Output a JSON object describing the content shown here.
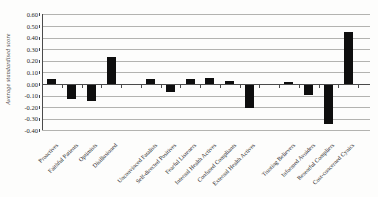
{
  "chart_data": {
    "type": "bar",
    "title": "",
    "xlabel": "",
    "ylabel": "Average standardised score",
    "ylim": [
      -0.4,
      0.6
    ],
    "ytick_step": 0.1,
    "ytick_labels": [
      "0.60",
      "0.50",
      "0.40",
      "0.30",
      "0.20",
      "0.10",
      "0.00",
      "-0.10",
      "-0.20",
      "-0.30",
      "-0.40"
    ],
    "grid": true,
    "legend": "none",
    "bar_color": "#0e0e0e",
    "gridline_color": "#b3b3b0",
    "axis_color": "#4a4a4a",
    "categories": [
      {
        "label": "Proactives",
        "value": 0.04
      },
      {
        "label": "Faithful Patients",
        "value": -0.12
      },
      {
        "label": "Optimists",
        "value": -0.14
      },
      {
        "label": "Disillusioned",
        "value": 0.23
      },
      {
        "label": "",
        "value": null
      },
      {
        "label": "Unconvinced Fatalists",
        "value": 0.045
      },
      {
        "label": "Self-directed Positives",
        "value": -0.06
      },
      {
        "label": "Fearful Listeners",
        "value": 0.045
      },
      {
        "label": "Internal Health Actives",
        "value": 0.055
      },
      {
        "label": "Confused Compliants",
        "value": 0.03
      },
      {
        "label": "External Health Actives",
        "value": -0.2
      },
      {
        "label": "",
        "value": null
      },
      {
        "label": "Trusting Believers",
        "value": 0.02
      },
      {
        "label": "Informed Avoiders",
        "value": -0.09
      },
      {
        "label": "Resentful Compliers",
        "value": -0.34
      },
      {
        "label": "Cost-concerned Cynics",
        "value": 0.45
      }
    ]
  }
}
